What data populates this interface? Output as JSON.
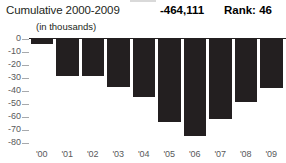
{
  "header": {
    "title": "Cumulative 2000-2009",
    "value": "-464,111",
    "rank": "Rank: 46"
  },
  "units_note": "(in thousands)",
  "chart_data": {
    "type": "bar",
    "title": "Cumulative 2000-2009",
    "subtitle": "(in thousands)",
    "xlabel": "",
    "ylabel": "",
    "categories": [
      "'00",
      "'01",
      "'02",
      "'03",
      "'04",
      "'05",
      "'06",
      "'07",
      "'08",
      "'09"
    ],
    "values": [
      -4,
      -29,
      -29,
      -37,
      -45,
      -64,
      -75,
      -62,
      -49,
      -38
    ],
    "ylim": [
      -80,
      0
    ],
    "ytick_labels": [
      "0",
      "-10",
      "-20",
      "-30",
      "-40",
      "-50",
      "-60",
      "-70",
      "-80"
    ],
    "ytick_values": [
      0,
      -10,
      -20,
      -30,
      -40,
      -50,
      -60,
      -70,
      -80
    ],
    "grid": false,
    "legend": false,
    "bar_color": "#231f20",
    "axis_color": "#231f20",
    "tick_color": "#a7a9ac",
    "label_color": "#58595b",
    "annotations": [
      {
        "text": "-464,111",
        "role": "cumulative-total"
      },
      {
        "text": "Rank: 46",
        "role": "rank"
      }
    ]
  }
}
